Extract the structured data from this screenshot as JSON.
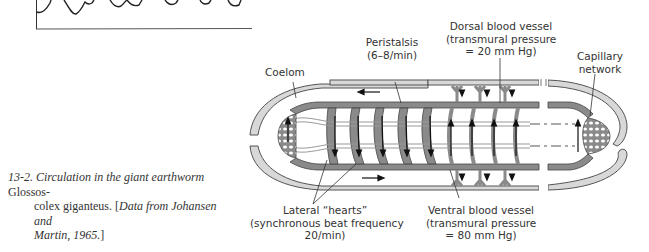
{
  "figure": {
    "number": "13-2.",
    "caption_italic_1": "Circulation in the giant earthworm",
    "caption_species": "Glossoscolex giganteus.",
    "caption_species_1": "Glossos-",
    "caption_species_2": "colex giganteus.",
    "caption_source_open": "[",
    "caption_source_italic": "Data from Johansen and Martin, 1965.",
    "caption_source_italic_1": "Data from Johansen and",
    "caption_source_italic_2": "Martin, 1965.",
    "caption_source_close": "]"
  },
  "labels": {
    "coelom": "Coelom",
    "peristalsis_1": "Peristalsis",
    "peristalsis_2": "(6–8/min)",
    "dorsal_1": "Dorsal blood vessel",
    "dorsal_2": "(transmural pressure",
    "dorsal_3": "= 20 mm Hg)",
    "capillary_1": "Capillary",
    "capillary_2": "network",
    "hearts_1": "Lateral “hearts”",
    "hearts_2": "(synchronous beat frequency",
    "hearts_3": "20/min)",
    "ventral_1": "Ventral blood vessel",
    "ventral_2": "(transmural pressure",
    "ventral_3": "= 80 mm Hg)"
  },
  "colors": {
    "vessel_fill": "#8a8a8a",
    "coelom_fill": "#d8d8d8",
    "line": "#2a2a2a",
    "background": "#ffffff"
  },
  "top_fragment": {
    "description": "partial waveform plot from previous figure (cropped)"
  }
}
